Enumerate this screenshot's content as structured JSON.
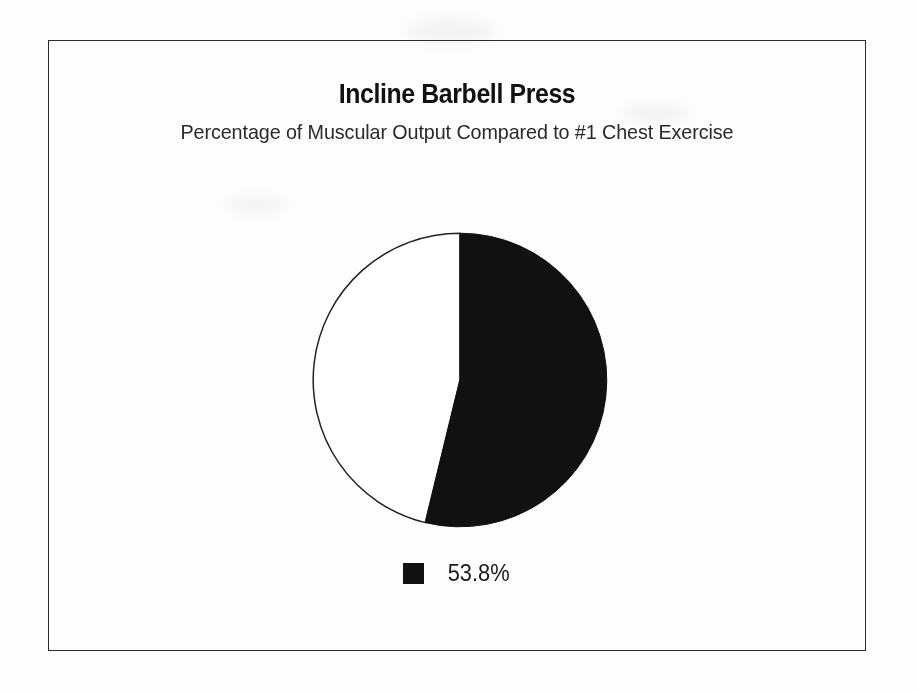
{
  "document": {
    "kind": "scanned-chart-page",
    "background_color": "#fdfdfd"
  },
  "frame": {
    "border_color": "#2b2b2b"
  },
  "header": {
    "title": "Incline Barbell Press",
    "subtitle": "Percentage of Muscular Output Compared to #1 Chest Exercise"
  },
  "legend": {
    "position": "bottom",
    "entries": [
      {
        "label": "53.8%",
        "swatch_color": "#111111",
        "swatch_icon": "filled-square-icon"
      }
    ]
  },
  "chart_data": {
    "type": "pie",
    "title": "Incline Barbell Press",
    "subtitle": "Percentage of Muscular Output Compared to #1 Chest Exercise",
    "xlabel": "",
    "ylabel": "",
    "unit": "%",
    "start_angle_deg": 0,
    "direction": "clockwise",
    "categories": [
      "53.8%",
      "Remainder"
    ],
    "values": [
      53.8,
      46.2
    ],
    "data_labels": [
      "53.8%"
    ],
    "colors": [
      "#111111",
      "#ffffff"
    ],
    "slice_outline_color": "#222222",
    "legend": [
      "53.8%"
    ],
    "legend_position": "bottom",
    "grid": false,
    "annotations": [],
    "geometry": {
      "center_x": 458,
      "center_y": 379,
      "radius": 147,
      "highlighted_slice_sweep_deg": 193.68
    }
  }
}
